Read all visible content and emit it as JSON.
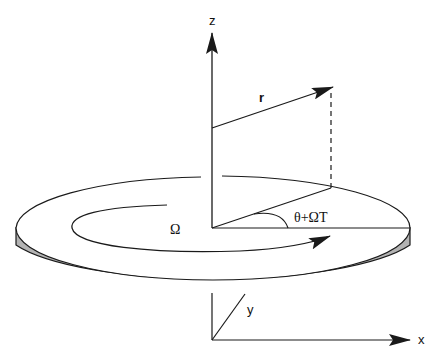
{
  "diagram": {
    "type": "rotating-disc-coordinate-frame",
    "colors": {
      "stroke": "#1a1a1a",
      "disc_side": "#b3b3b3",
      "disc_top": "#ffffff",
      "background": "#ffffff"
    },
    "labels": {
      "z_axis": "z",
      "x_axis": "x",
      "y_axis": "y",
      "position_vector": "r",
      "angular_velocity": "Ω",
      "angle": "θ+ΩT"
    },
    "elements": [
      "z-axis arrow (vertical, from disc center upward)",
      "position vector r (arrow from disc center)",
      "dashed vertical projection of r onto disc plane",
      "projection line on disc surface",
      "angle arc labeled θ+ΩT",
      "reference line from center to disc rim (x direction)",
      "inner rotation arrow labeled Ω",
      "disc with gray side thickness",
      "lab frame axes x and y below disc"
    ]
  }
}
